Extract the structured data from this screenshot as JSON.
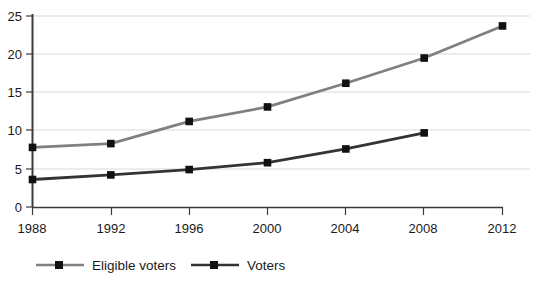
{
  "chart_data": {
    "type": "line",
    "title": "",
    "subtitle": "",
    "xlabel": "",
    "ylabel": "",
    "x": [
      1988,
      1992,
      1996,
      2000,
      2004,
      2008,
      2012
    ],
    "categories": [
      "1988",
      "1992",
      "1996",
      "2000",
      "2004",
      "2008",
      "2012"
    ],
    "xlim": [
      1988,
      2012
    ],
    "ylim": [
      0,
      25
    ],
    "yticks": [
      0,
      5,
      10,
      15,
      20,
      25
    ],
    "ytick_labels": [
      "0",
      "5",
      "10",
      "15",
      "20",
      "25"
    ],
    "xtick_labels": [
      "1988",
      "1992",
      "1996",
      "2000",
      "2004",
      "2008",
      "2012"
    ],
    "grid": true,
    "grid_axis": "y",
    "legend_position": "bottom",
    "marker": "square",
    "series": [
      {
        "name": "Eligible voters",
        "color": "#808080",
        "x": [
          1988,
          1992,
          1996,
          2000,
          2004,
          2008,
          2012
        ],
        "values": [
          7.8,
          8.3,
          11.2,
          13.1,
          16.2,
          19.5,
          23.7
        ]
      },
      {
        "name": "Voters",
        "color": "#333333",
        "x": [
          1988,
          1992,
          1996,
          2000,
          2004,
          2008
        ],
        "values": [
          3.6,
          4.2,
          4.9,
          5.8,
          7.6,
          9.7
        ]
      }
    ]
  },
  "axis": {
    "y_tick_0": "0",
    "y_tick_1": "5",
    "y_tick_2": "10",
    "y_tick_3": "15",
    "y_tick_4": "20",
    "y_tick_5": "25",
    "x_tick_0": "1988",
    "x_tick_1": "1992",
    "x_tick_2": "1996",
    "x_tick_3": "2000",
    "x_tick_4": "2004",
    "x_tick_5": "2008",
    "x_tick_6": "2012"
  },
  "legend": {
    "items": [
      {
        "label": "Eligible voters",
        "color": "#808080"
      },
      {
        "label": "Voters",
        "color": "#333333"
      }
    ]
  },
  "colors": {
    "eligible_voters": "#808080",
    "voters": "#333333",
    "axis": "#3b3b3b",
    "grid": "#d9d9d9",
    "background": "#ffffff",
    "text": "#1a1a1a"
  }
}
